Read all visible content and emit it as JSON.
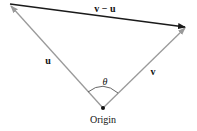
{
  "diagram": {
    "type": "vector-subtraction",
    "labels": {
      "diff": "v − u",
      "u": "u",
      "v": "v",
      "angle": "θ",
      "origin": "Origin"
    },
    "points": {
      "origin": [
        103,
        108
      ],
      "u_head": [
        10,
        4
      ],
      "v_head": [
        186,
        27
      ]
    },
    "colors": {
      "u": "#9a9a9a",
      "v": "#9a9a9a",
      "diff": "#1a1a1a",
      "arc": "#555555",
      "text": "#111111"
    }
  }
}
